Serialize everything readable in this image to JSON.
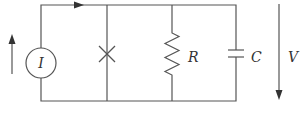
{
  "diagram": {
    "type": "circuit",
    "components": [
      {
        "id": "current-source",
        "symbol": "circle",
        "label": "I"
      },
      {
        "id": "nonlinear-element",
        "symbol": "cross",
        "label": ""
      },
      {
        "id": "resistor",
        "symbol": "zigzag",
        "label": "R"
      },
      {
        "id": "capacitor",
        "symbol": "parallel-plates",
        "label": "C"
      }
    ],
    "voltage": {
      "label": "V",
      "direction": "down"
    },
    "current_direction": "up",
    "wire_current_direction": "right"
  },
  "labels": {
    "source": "I",
    "resistor": "R",
    "capacitor": "C",
    "voltage": "V"
  },
  "colors": {
    "wire": "#555555",
    "text": "#333333",
    "background": "#ffffff"
  }
}
